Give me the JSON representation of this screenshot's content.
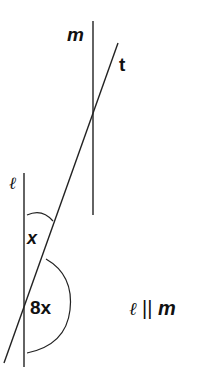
{
  "diagram": {
    "lines": {
      "m": {
        "label": "m",
        "x": 93,
        "y1": 21,
        "y2": 215
      },
      "l": {
        "label": "ℓ",
        "x": 24,
        "y1": 173,
        "y2": 367
      },
      "t": {
        "label": "t",
        "x1": 118,
        "y1": 43,
        "x2": 4,
        "y2": 363
      }
    },
    "angles": {
      "upper": {
        "label": "x"
      },
      "lower": {
        "label": "8x"
      }
    },
    "note": {
      "script_l": "ℓ",
      "parallel": "||",
      "m": "m"
    },
    "colors": {
      "stroke": "#222222",
      "text": "#111111"
    }
  }
}
